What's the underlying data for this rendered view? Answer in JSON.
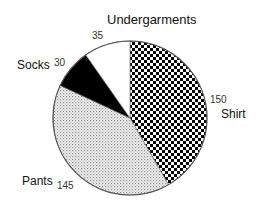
{
  "chart_data": {
    "type": "pie",
    "title": "",
    "start_angle_deg": 0,
    "direction": "clockwise",
    "total": 360,
    "slices": [
      {
        "label": "Shirt",
        "value": 150,
        "pattern": "checker",
        "color": "#000000"
      },
      {
        "label": "Pants",
        "value": 145,
        "pattern": "fine-dots",
        "color": "#888888"
      },
      {
        "label": "Socks",
        "value": 30,
        "pattern": "solid",
        "color": "#000000"
      },
      {
        "label": "Undergarments",
        "value": 35,
        "pattern": "none",
        "color": "#ffffff"
      }
    ],
    "legend": "none (labels placed outside slices)"
  },
  "labels": {
    "shirt": {
      "name": "Shirt",
      "value": "150"
    },
    "pants": {
      "name": "Pants",
      "value": "145"
    },
    "socks": {
      "name": "Socks",
      "value": "30"
    },
    "undergarments": {
      "name": "Undergarments",
      "value": "35"
    }
  }
}
